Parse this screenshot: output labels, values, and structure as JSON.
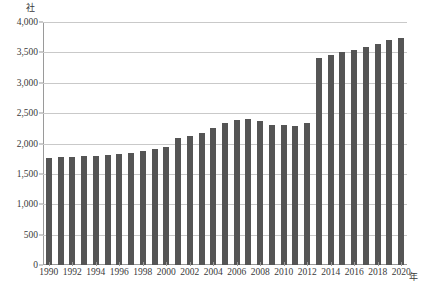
{
  "chart_data": {
    "type": "bar",
    "title": "",
    "xlabel": "年",
    "ylabel": "社",
    "ylim": [
      0,
      4000
    ],
    "ytick_values": [
      0,
      500,
      1000,
      1500,
      2000,
      2500,
      3000,
      3500,
      4000
    ],
    "ytick_labels": [
      "0",
      "500",
      "1,000",
      "1,500",
      "2,000",
      "2,500",
      "3,000",
      "3,500",
      "4,000"
    ],
    "grid": true,
    "legend": null,
    "bar_color": "#555555",
    "categories": [
      "1990",
      "1991",
      "1992",
      "1993",
      "1994",
      "1995",
      "1996",
      "1997",
      "1998",
      "1999",
      "2000",
      "2001",
      "2002",
      "2003",
      "2004",
      "2005",
      "2006",
      "2007",
      "2008",
      "2009",
      "2010",
      "2011",
      "2012",
      "2013",
      "2014",
      "2015",
      "2016",
      "2017",
      "2018",
      "2019",
      "2020"
    ],
    "values": [
      1760,
      1770,
      1780,
      1790,
      1800,
      1810,
      1820,
      1850,
      1880,
      1910,
      1940,
      2090,
      2120,
      2180,
      2260,
      2340,
      2390,
      2400,
      2370,
      2300,
      2310,
      2290,
      2330,
      3410,
      3450,
      3510,
      3540,
      3590,
      3640,
      3700,
      3730
    ],
    "xtick_labels": [
      "1990",
      "1992",
      "1994",
      "1996",
      "1998",
      "2000",
      "2002",
      "2004",
      "2006",
      "2008",
      "2010",
      "2012",
      "2014",
      "2016",
      "2018",
      "2020"
    ]
  }
}
